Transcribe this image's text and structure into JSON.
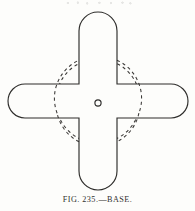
{
  "figure": {
    "caption_label": "FIG.",
    "caption_number": "235.",
    "caption_dash": "—",
    "caption_title": "BASE.",
    "caption_full": "FIG. 235.—BASE.",
    "alt_description": "Line drawing of a cross-shaped metal base plate with rounded arm ends, a dashed construction circle centered on the crossing, and a small center hole.",
    "background_color": "#fdfdfb",
    "line_color": "#2e2d2b",
    "dashed_line_color": "#3a3836",
    "line_width": 1.1
  },
  "drawing": {
    "type": "technical-line-drawing",
    "canvas": {
      "width": 195,
      "height": 211
    },
    "vertical_arm": {
      "name": "vertical-arm",
      "x_left": 79,
      "x_right": 117,
      "y_top": 12,
      "y_bottom": 190,
      "width": 38,
      "corner_radius": 19,
      "end_shape": "rounded"
    },
    "horizontal_arm": {
      "name": "horizontal-arm",
      "x_left": 8,
      "x_right": 188,
      "y_top": 84,
      "y_bottom": 118,
      "height": 34,
      "corner_radius": 17,
      "end_shape": "rounded"
    },
    "dashed_circle": {
      "name": "construction-circle",
      "center_x": 98,
      "center_y": 101,
      "radius": 42,
      "style": "dashed",
      "dash_pattern": "3 3"
    },
    "center_hole": {
      "name": "center-hole",
      "center_x": 98,
      "center_y": 103,
      "radius": 3.1
    }
  }
}
